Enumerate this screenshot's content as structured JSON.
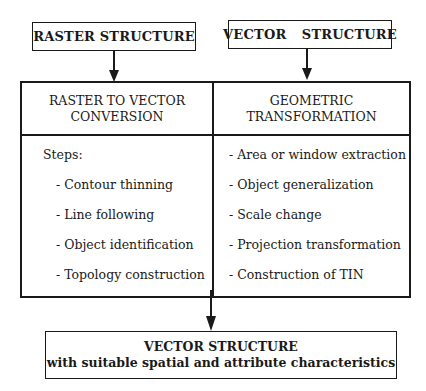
{
  "top_boxes": {
    "raster": "RASTER STRUCTURE",
    "vector": "VECTOR  STRUCTURE"
  },
  "columns": {
    "left": {
      "title_line1": "RASTER TO VECTOR",
      "title_line2": "CONVERSION",
      "intro": "Steps:",
      "items": [
        "- Contour thinning",
        "- Line following",
        "- Object identification",
        "- Topology construction"
      ]
    },
    "right": {
      "title_line1": "GEOMETRIC",
      "title_line2": "TRANSFORMATION",
      "items": [
        "- Area or window extraction",
        "- Object generalization",
        "- Scale change",
        "- Projection transformation",
        "- Construction of TIN"
      ]
    }
  },
  "bottom_box": {
    "title": "VECTOR STRUCTURE",
    "subtitle": "with suitable spatial and attribute characteristics"
  }
}
